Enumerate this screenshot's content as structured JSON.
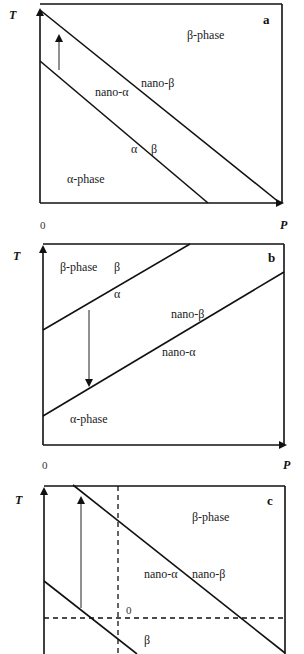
{
  "figure": {
    "panels": [
      {
        "id": "a",
        "panel_label": "a",
        "y_axis_label": "T",
        "x_axis_label": "P",
        "origin_label": "0",
        "regions": {
          "beta_phase": "β-phase",
          "alpha_phase": "α-phase",
          "nano_alpha": "nano-α",
          "nano_beta": "nano-β",
          "alpha": "α",
          "beta": "β"
        },
        "arrow_direction": "up"
      },
      {
        "id": "b",
        "panel_label": "b",
        "y_axis_label": "T",
        "x_axis_label": "P",
        "origin_label": "0",
        "regions": {
          "beta_phase": "β-phase",
          "beta": "β",
          "alpha": "α",
          "nano_beta": "nano-β",
          "nano_alpha": "nano-α",
          "alpha_phase": "α-phase"
        },
        "arrow_direction": "down"
      },
      {
        "id": "c",
        "panel_label": "c",
        "y_axis_label": "T",
        "regions": {
          "beta_phase": "β-phase",
          "nano_alpha": "nano-α",
          "nano_beta": "nano-β",
          "beta": "β"
        },
        "dashed_origin_label": "0",
        "arrow_direction": "up"
      }
    ]
  }
}
